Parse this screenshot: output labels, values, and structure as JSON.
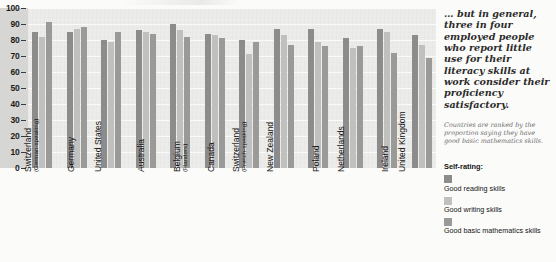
{
  "chart_data": {
    "type": "bar",
    "title": "",
    "xlabel": "",
    "ylabel": "",
    "ylim": [
      0,
      100
    ],
    "ytick_values": [
      100,
      90,
      80,
      70,
      60,
      50,
      40,
      30,
      20,
      10,
      0
    ],
    "grid": true,
    "legend_position": "right",
    "legend_title": "Self-rating:",
    "categories": [
      "Switzerland (German-speaking)",
      "Germany",
      "United States",
      "Australia",
      "Belgium (Flanders)",
      "Canada",
      "Switzerland (French-speaking)",
      "New Zealand",
      "Poland",
      "Netherlands",
      "Ireland",
      "United Kingdom"
    ],
    "category_labels": [
      {
        "main": "Switzerland",
        "sub": "(German-speaking)"
      },
      {
        "main": "Germany",
        "sub": ""
      },
      {
        "main": "United States",
        "sub": ""
      },
      {
        "main": "Australia",
        "sub": ""
      },
      {
        "main": "Belgium",
        "sub": "(Flanders)"
      },
      {
        "main": "Canada",
        "sub": ""
      },
      {
        "main": "Switzerland",
        "sub": "(French-speaking)"
      },
      {
        "main": "New Zealand",
        "sub": ""
      },
      {
        "main": "Poland",
        "sub": ""
      },
      {
        "main": "Netherlands",
        "sub": ""
      },
      {
        "main": "Ireland",
        "sub": ""
      },
      {
        "main": "United Kingdom",
        "sub": ""
      }
    ],
    "series": [
      {
        "name": "Good reading skills",
        "color": "#8c8c8c",
        "values": [
          85,
          85,
          80,
          86,
          90,
          84,
          80,
          87,
          87,
          81,
          87,
          83
        ]
      },
      {
        "name": "Good writing skills",
        "color": "#c0c0bf",
        "values": [
          82,
          87,
          79,
          85,
          86,
          83,
          71,
          83,
          79,
          75,
          85,
          77
        ]
      },
      {
        "name": "Good basic mathematics skills",
        "color": "#9a9a99",
        "values": [
          91,
          88,
          85,
          84,
          82,
          81,
          79,
          77,
          76,
          76,
          72,
          69
        ]
      }
    ]
  },
  "annotations": {
    "pullquote": "… but in general, three in four employed people who report little use for their literacy skills at work consider their proficiency satisfactory.",
    "caption": "Countries are ranked by the proportion saying they have good basic mathematics skills."
  },
  "legend": {
    "title": "Self-rating:",
    "items": [
      {
        "label": "Good reading skills",
        "color": "#8c8c8c"
      },
      {
        "label": "Good writing skills",
        "color": "#c0c0bf"
      },
      {
        "label": "Good basic mathematics skills",
        "color": "#9a9a99"
      }
    ]
  }
}
